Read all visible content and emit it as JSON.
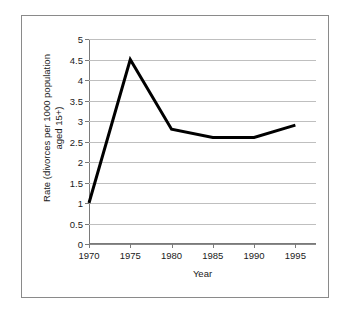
{
  "chart_data": {
    "type": "line",
    "title": "",
    "xlabel": "Year",
    "ylabel": "Rate (divorces per 1000 population\naged 15+)",
    "x": [
      1970,
      1975,
      1980,
      1985,
      1990,
      1995
    ],
    "categories": [
      "1970",
      "1975",
      "1980",
      "1985",
      "1990",
      "1995"
    ],
    "series": [
      {
        "name": "Divorce rate",
        "values": [
          1,
          4.5,
          2.8,
          2.6,
          2.6,
          2.9
        ],
        "color": "#000000",
        "line_width": 3,
        "markers": false
      }
    ],
    "ylim": [
      0,
      5
    ],
    "ytick_step": 0.5,
    "yticks": [
      0,
      0.5,
      1,
      1.5,
      2,
      2.5,
      3,
      3.5,
      4,
      4.5,
      5
    ],
    "ytick_labels": [
      "0",
      "0.5",
      "1",
      "1.5",
      "2",
      "2.5",
      "3",
      "3.5",
      "4",
      "4.5",
      "5"
    ],
    "xtick_labels": [
      "1970",
      "1975",
      "1980",
      "1985",
      "1990",
      "1995"
    ],
    "xlim": [
      1970,
      1997.5
    ],
    "grid": "horizontal",
    "legend": "none",
    "plot_background": "#ffffff",
    "gridline_color": "#bfbfbf",
    "axis_color": "#7a7a7a",
    "frame_border_color": "#8a8a8a"
  }
}
